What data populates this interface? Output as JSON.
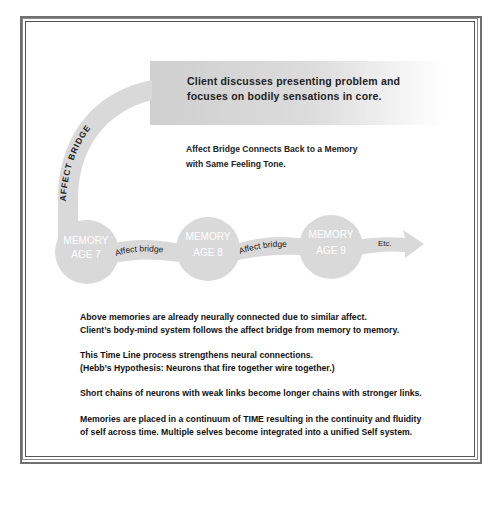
{
  "diagram": {
    "top_box": {
      "line1": "Client discusses presenting problem and",
      "line2": "focuses on bodily sensations in core."
    },
    "arc_label": "AFFECT BRIDGE",
    "connect_note": {
      "line1": "Affect Bridge Connects Back to a Memory",
      "line2": "with Same Feeling Tone."
    },
    "memories": [
      {
        "line1": "MEMORY",
        "line2": "AGE 7"
      },
      {
        "line1": "MEMORY",
        "line2": "AGE 8"
      },
      {
        "line1": "MEMORY",
        "line2": "AGE 9"
      }
    ],
    "bridges": [
      "Affect bridge",
      "Affect bridge"
    ],
    "end_label": "Etc.",
    "colors": {
      "shape_fill": "#d9d9d9",
      "memory_text": "#ffffff",
      "text": "#222222",
      "border": "#666666"
    }
  },
  "notes": [
    {
      "line1": "Above memories are already neurally connected due to similar affect.",
      "line2": "Client’s body-mind system follows the affect bridge from memory to memory."
    },
    {
      "line1": "This Time Line process strengthens neural connections.",
      "line2": "(Hebb’s Hypothesis: Neurons that fire together wire together.)"
    },
    {
      "line1": "Short chains of neurons with weak links become longer chains with stronger links.",
      "line2": ""
    },
    {
      "line1": "Memories are placed in a continuum of TIME resulting in the continuity and fluidity",
      "line2": "of self across time. Multiple selves become integrated into a unified Self system."
    }
  ]
}
